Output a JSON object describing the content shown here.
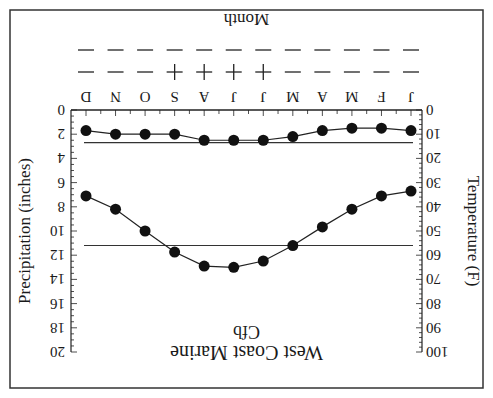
{
  "chart_data": {
    "type": "line",
    "title": "West Coast Marine",
    "subtitle": "Cfb",
    "xlabel": "Month",
    "categories": [
      "J",
      "F",
      "M",
      "A",
      "M",
      "J",
      "J",
      "A",
      "S",
      "O",
      "N",
      "D"
    ],
    "y_left": {
      "label": "Precipitation (inches)",
      "range": [
        0,
        20
      ],
      "ticks": [
        0,
        2,
        4,
        6,
        8,
        10,
        12,
        14,
        16,
        18,
        20
      ],
      "inverted_display": true
    },
    "y_right": {
      "label": "Temperature (F)",
      "range": [
        0,
        100
      ],
      "ticks": [
        0,
        10,
        20,
        30,
        40,
        50,
        60,
        70,
        80,
        90,
        100
      ],
      "inverted_display": true
    },
    "series": [
      {
        "name": "Precipitation",
        "axis": "left",
        "unit": "inches",
        "values": [
          1.7,
          1.5,
          1.5,
          1.7,
          2.2,
          2.5,
          2.5,
          2.5,
          2.0,
          2.0,
          2.0,
          1.7
        ],
        "reference_line": 2.7
      },
      {
        "name": "Temperature",
        "axis": "right",
        "unit": "F",
        "values": [
          33.5,
          35.5,
          41,
          48.3,
          56,
          62.4,
          65,
          64.5,
          58.7,
          50,
          41,
          35.5
        ],
        "reference_line": 56
      }
    ],
    "symbol_rows": [
      [
        "-",
        "-",
        "-",
        "-",
        "-",
        "+",
        "+",
        "+",
        "+",
        "-",
        "-",
        "-"
      ],
      [
        "-",
        "-",
        "-",
        "-",
        "-",
        "-",
        "-",
        "-",
        "-",
        "-",
        "-",
        "-"
      ]
    ],
    "grid": false,
    "legend": "none",
    "orientation": "rotated 180 degrees"
  }
}
